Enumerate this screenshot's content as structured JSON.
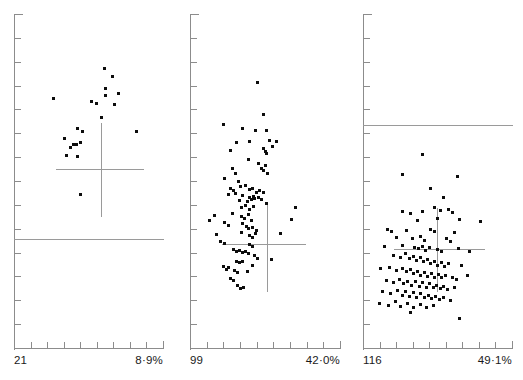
{
  "figure": {
    "background_color": "#ffffff",
    "dot_color": "#0d0d0d",
    "axis_color": "#8c8c8c",
    "line_color": "#9a9a9a"
  },
  "chart_data": {
    "type": "scatter",
    "title": "",
    "xlabel": "",
    "ylabel": "",
    "grid": false,
    "legend": "none",
    "panel_count": 3,
    "panels": [
      {
        "name": "panel-1",
        "sample_size_label": "21",
        "sample_size": 21,
        "max_percent_label": "8·9%",
        "max_percent": 8.9,
        "x_axis_ticks": 8,
        "y_axis_ticks": 13,
        "reference_line_y_frac": 0.675,
        "cross_center_x_frac": 0.585,
        "cross_center_y_frac": 0.465,
        "cross_arm_left_frac": 0.28,
        "cross_arm_right_frac": 0.87,
        "cross_arm_top_frac": 0.325,
        "cross_arm_bottom_frac": 0.605,
        "points": [
          [
            0.605,
            0.162
          ],
          [
            0.662,
            0.188
          ],
          [
            0.614,
            0.222
          ],
          [
            0.614,
            0.243
          ],
          [
            0.7,
            0.238
          ],
          [
            0.52,
            0.263
          ],
          [
            0.557,
            0.268
          ],
          [
            0.672,
            0.272
          ],
          [
            0.262,
            0.254
          ],
          [
            0.59,
            0.31
          ],
          [
            0.428,
            0.342
          ],
          [
            0.462,
            0.352
          ],
          [
            0.822,
            0.352
          ],
          [
            0.34,
            0.374
          ],
          [
            0.398,
            0.39
          ],
          [
            0.42,
            0.392
          ],
          [
            0.448,
            0.385
          ],
          [
            0.378,
            0.4
          ],
          [
            0.352,
            0.425
          ],
          [
            0.428,
            0.428
          ],
          [
            0.448,
            0.54
          ]
        ]
      },
      {
        "name": "panel-2",
        "sample_size_label": "99",
        "sample_size": 99,
        "max_percent_label": "42·0%",
        "max_percent": 42.0,
        "x_axis_ticks": 8,
        "y_axis_ticks": 13,
        "reference_line_y_frac": null,
        "cross_center_x_frac": 0.512,
        "cross_center_y_frac": 0.69,
        "cross_arm_left_frac": 0.215,
        "cross_arm_right_frac": 0.775,
        "cross_arm_top_frac": 0.565,
        "cross_arm_bottom_frac": 0.832,
        "points": [
          [
            0.452,
            0.205
          ],
          [
            0.492,
            0.3
          ],
          [
            0.222,
            0.332
          ],
          [
            0.348,
            0.344
          ],
          [
            0.438,
            0.349
          ],
          [
            0.508,
            0.348
          ],
          [
            0.31,
            0.385
          ],
          [
            0.398,
            0.383
          ],
          [
            0.53,
            0.379
          ],
          [
            0.578,
            0.382
          ],
          [
            0.268,
            0.408
          ],
          [
            0.492,
            0.402
          ],
          [
            0.502,
            0.412
          ],
          [
            0.512,
            0.418
          ],
          [
            0.548,
            0.398
          ],
          [
            0.392,
            0.437
          ],
          [
            0.455,
            0.448
          ],
          [
            0.478,
            0.462
          ],
          [
            0.492,
            0.47
          ],
          [
            0.505,
            0.455
          ],
          [
            0.518,
            0.478
          ],
          [
            0.282,
            0.462
          ],
          [
            0.302,
            0.478
          ],
          [
            0.228,
            0.492
          ],
          [
            0.322,
            0.502
          ],
          [
            0.338,
            0.516
          ],
          [
            0.372,
            0.512
          ],
          [
            0.268,
            0.522
          ],
          [
            0.288,
            0.528
          ],
          [
            0.395,
            0.525
          ],
          [
            0.418,
            0.522
          ],
          [
            0.258,
            0.54
          ],
          [
            0.3,
            0.538
          ],
          [
            0.352,
            0.542
          ],
          [
            0.398,
            0.548
          ],
          [
            0.422,
            0.545
          ],
          [
            0.445,
            0.535
          ],
          [
            0.465,
            0.528
          ],
          [
            0.488,
            0.533
          ],
          [
            0.332,
            0.558
          ],
          [
            0.385,
            0.562
          ],
          [
            0.41,
            0.556
          ],
          [
            0.432,
            0.552
          ],
          [
            0.455,
            0.548
          ],
          [
            0.478,
            0.555
          ],
          [
            0.508,
            0.568
          ],
          [
            0.345,
            0.578
          ],
          [
            0.372,
            0.572
          ],
          [
            0.398,
            0.585
          ],
          [
            0.425,
            0.575
          ],
          [
            0.7,
            0.578
          ],
          [
            0.162,
            0.602
          ],
          [
            0.282,
            0.598
          ],
          [
            0.342,
            0.605
          ],
          [
            0.365,
            0.612
          ],
          [
            0.388,
            0.6
          ],
          [
            0.408,
            0.618
          ],
          [
            0.132,
            0.618
          ],
          [
            0.232,
            0.625
          ],
          [
            0.258,
            0.632
          ],
          [
            0.352,
            0.628
          ],
          [
            0.375,
            0.635
          ],
          [
            0.392,
            0.642
          ],
          [
            0.418,
            0.638
          ],
          [
            0.44,
            0.648
          ],
          [
            0.678,
            0.615
          ],
          [
            0.175,
            0.66
          ],
          [
            0.342,
            0.655
          ],
          [
            0.398,
            0.662
          ],
          [
            0.418,
            0.668
          ],
          [
            0.438,
            0.658
          ],
          [
            0.605,
            0.658
          ],
          [
            0.205,
            0.682
          ],
          [
            0.228,
            0.688
          ],
          [
            0.395,
            0.69
          ],
          [
            0.418,
            0.695
          ],
          [
            0.288,
            0.705
          ],
          [
            0.308,
            0.712
          ],
          [
            0.328,
            0.708
          ],
          [
            0.348,
            0.715
          ],
          [
            0.368,
            0.71
          ],
          [
            0.388,
            0.718
          ],
          [
            0.432,
            0.722
          ],
          [
            0.452,
            0.732
          ],
          [
            0.545,
            0.735
          ],
          [
            0.312,
            0.742
          ],
          [
            0.332,
            0.745
          ],
          [
            0.352,
            0.74
          ],
          [
            0.418,
            0.752
          ],
          [
            0.222,
            0.755
          ],
          [
            0.24,
            0.765
          ],
          [
            0.258,
            0.758
          ],
          [
            0.298,
            0.768
          ],
          [
            0.318,
            0.775
          ],
          [
            0.385,
            0.772
          ],
          [
            0.272,
            0.792
          ],
          [
            0.292,
            0.798
          ],
          [
            0.318,
            0.812
          ],
          [
            0.338,
            0.822
          ],
          [
            0.355,
            0.818
          ]
        ]
      },
      {
        "name": "panel-3",
        "sample_size_label": "116",
        "sample_size": 116,
        "max_percent_label": "49·1%",
        "max_percent": 49.1,
        "x_axis_ticks": 8,
        "y_axis_ticks": 13,
        "reference_line_y_frac": 0.332,
        "cross_center_x_frac": 0.498,
        "cross_center_y_frac": 0.705,
        "cross_arm_left_frac": 0.205,
        "cross_arm_right_frac": 0.818,
        "cross_arm_top_frac": 0.58,
        "cross_arm_bottom_frac": 0.832,
        "points": [
          [
            0.4,
            0.422
          ],
          [
            0.268,
            0.482
          ],
          [
            0.632,
            0.488
          ],
          [
            0.455,
            0.522
          ],
          [
            0.54,
            0.548
          ],
          [
            0.478,
            0.578
          ],
          [
            0.262,
            0.592
          ],
          [
            0.318,
            0.598
          ],
          [
            0.398,
            0.592
          ],
          [
            0.518,
            0.588
          ],
          [
            0.575,
            0.585
          ],
          [
            0.602,
            0.595
          ],
          [
            0.368,
            0.618
          ],
          [
            0.498,
            0.612
          ],
          [
            0.648,
            0.615
          ],
          [
            0.788,
            0.622
          ],
          [
            0.165,
            0.645
          ],
          [
            0.192,
            0.652
          ],
          [
            0.295,
            0.648
          ],
          [
            0.452,
            0.645
          ],
          [
            0.478,
            0.652
          ],
          [
            0.612,
            0.655
          ],
          [
            0.228,
            0.668
          ],
          [
            0.335,
            0.672
          ],
          [
            0.388,
            0.665
          ],
          [
            0.412,
            0.678
          ],
          [
            0.562,
            0.672
          ],
          [
            0.588,
            0.682
          ],
          [
            0.145,
            0.695
          ],
          [
            0.268,
            0.692
          ],
          [
            0.345,
            0.698
          ],
          [
            0.372,
            0.702
          ],
          [
            0.398,
            0.695
          ],
          [
            0.422,
            0.708
          ],
          [
            0.448,
            0.7
          ],
          [
            0.502,
            0.705
          ],
          [
            0.528,
            0.712
          ],
          [
            0.638,
            0.702
          ],
          [
            0.718,
            0.712
          ],
          [
            0.205,
            0.722
          ],
          [
            0.252,
            0.728
          ],
          [
            0.288,
            0.718
          ],
          [
            0.312,
            0.732
          ],
          [
            0.338,
            0.725
          ],
          [
            0.362,
            0.738
          ],
          [
            0.385,
            0.73
          ],
          [
            0.408,
            0.742
          ],
          [
            0.432,
            0.735
          ],
          [
            0.455,
            0.748
          ],
          [
            0.478,
            0.74
          ],
          [
            0.502,
            0.752
          ],
          [
            0.525,
            0.745
          ],
          [
            0.548,
            0.755
          ],
          [
            0.572,
            0.748
          ],
          [
            0.658,
            0.752
          ],
          [
            0.118,
            0.762
          ],
          [
            0.178,
            0.758
          ],
          [
            0.228,
            0.768
          ],
          [
            0.265,
            0.762
          ],
          [
            0.292,
            0.772
          ],
          [
            0.318,
            0.765
          ],
          [
            0.342,
            0.778
          ],
          [
            0.365,
            0.77
          ],
          [
            0.388,
            0.782
          ],
          [
            0.412,
            0.775
          ],
          [
            0.435,
            0.785
          ],
          [
            0.458,
            0.778
          ],
          [
            0.482,
            0.788
          ],
          [
            0.505,
            0.78
          ],
          [
            0.528,
            0.79
          ],
          [
            0.552,
            0.782
          ],
          [
            0.598,
            0.788
          ],
          [
            0.625,
            0.795
          ],
          [
            0.698,
            0.782
          ],
          [
            0.155,
            0.798
          ],
          [
            0.205,
            0.805
          ],
          [
            0.248,
            0.795
          ],
          [
            0.275,
            0.808
          ],
          [
            0.302,
            0.8
          ],
          [
            0.328,
            0.812
          ],
          [
            0.352,
            0.802
          ],
          [
            0.378,
            0.815
          ],
          [
            0.402,
            0.805
          ],
          [
            0.425,
            0.818
          ],
          [
            0.448,
            0.808
          ],
          [
            0.472,
            0.82
          ],
          [
            0.495,
            0.812
          ],
          [
            0.518,
            0.822
          ],
          [
            0.542,
            0.815
          ],
          [
            0.568,
            0.825
          ],
          [
            0.612,
            0.818
          ],
          [
            0.132,
            0.832
          ],
          [
            0.185,
            0.838
          ],
          [
            0.232,
            0.828
          ],
          [
            0.262,
            0.842
          ],
          [
            0.288,
            0.832
          ],
          [
            0.315,
            0.845
          ],
          [
            0.338,
            0.835
          ],
          [
            0.362,
            0.848
          ],
          [
            0.388,
            0.838
          ],
          [
            0.412,
            0.85
          ],
          [
            0.438,
            0.842
          ],
          [
            0.462,
            0.852
          ],
          [
            0.488,
            0.845
          ],
          [
            0.512,
            0.855
          ],
          [
            0.538,
            0.848
          ],
          [
            0.585,
            0.858
          ],
          [
            0.108,
            0.868
          ],
          [
            0.172,
            0.872
          ],
          [
            0.218,
            0.862
          ],
          [
            0.252,
            0.875
          ],
          [
            0.298,
            0.868
          ],
          [
            0.342,
            0.878
          ],
          [
            0.385,
            0.87
          ],
          [
            0.428,
            0.88
          ],
          [
            0.472,
            0.872
          ],
          [
            0.318,
            0.895
          ],
          [
            0.648,
            0.912
          ]
        ]
      }
    ]
  }
}
